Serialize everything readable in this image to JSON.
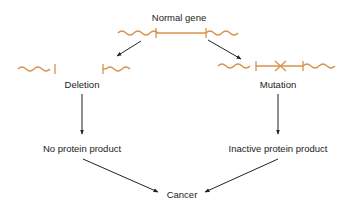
{
  "colors": {
    "gene": "#d9924a",
    "arrow": "#222222",
    "text": "#222222",
    "background": "#ffffff"
  },
  "nodes": {
    "normal_gene": {
      "label": "Normal gene"
    },
    "deletion": {
      "label": "Deletion"
    },
    "mutation": {
      "label": "Mutation"
    },
    "no_protein": {
      "label": "No protein product"
    },
    "inactive_protein": {
      "label": "Inactive protein product"
    },
    "cancer": {
      "label": "Cancer"
    }
  },
  "edges": [
    {
      "from": "normal_gene",
      "to": "deletion"
    },
    {
      "from": "normal_gene",
      "to": "mutation"
    },
    {
      "from": "deletion",
      "to": "no_protein"
    },
    {
      "from": "mutation",
      "to": "inactive_protein"
    },
    {
      "from": "no_protein",
      "to": "cancer"
    },
    {
      "from": "inactive_protein",
      "to": "cancer"
    }
  ],
  "glyphs": {
    "mutation_mark": "cross-icon"
  }
}
